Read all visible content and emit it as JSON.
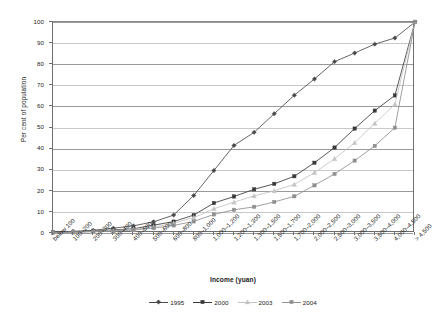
{
  "chart_data": {
    "type": "line",
    "title": "",
    "xlabel": "Income (yuan)",
    "ylabel": "Per cent of population",
    "ylim": [
      0,
      100
    ],
    "yticks": [
      0,
      10,
      20,
      30,
      40,
      50,
      60,
      70,
      80,
      90,
      100
    ],
    "grid": true,
    "legend_position": "bottom",
    "categories": [
      "below 100",
      "100–200",
      "200–300",
      "300–400",
      "400–500",
      "500–600",
      "600–800",
      "800–1,000",
      "1,000–1,200",
      "1,200–1,300",
      "1,300–1,500",
      "1,500–1,700",
      "1,700–2,000",
      "2,000–2,500",
      "2,500–3,000",
      "3,000–3,500",
      "3,500–4,000",
      "4,000–4,500",
      "> 4,500"
    ],
    "series": [
      {
        "name": "1995",
        "color": "#4a4a4a",
        "marker": "diamond",
        "values": [
          0.4,
          0.8,
          1.3,
          2.3,
          3.4,
          5.3,
          8.5,
          17.8,
          29.6,
          41.5,
          47.7,
          56.5,
          65.3,
          73.0,
          81.2,
          85.3,
          89.5,
          92.4,
          100
        ]
      },
      {
        "name": "2000",
        "color": "#3a3a3a",
        "marker": "square",
        "values": [
          0.3,
          0.5,
          0.9,
          1.5,
          2.0,
          3.7,
          5.4,
          8.5,
          14.2,
          17.3,
          20.7,
          23.3,
          26.9,
          33.3,
          40.5,
          49.5,
          58.0,
          65.2,
          100
        ]
      },
      {
        "name": "2003",
        "color": "#c4c4c4",
        "marker": "triangle",
        "values": [
          0.2,
          0.4,
          0.7,
          1.1,
          1.7,
          2.9,
          4.6,
          7.3,
          11.5,
          14.6,
          17.6,
          20.0,
          23.0,
          28.6,
          35.2,
          42.8,
          52.0,
          61.0,
          100
        ]
      },
      {
        "name": "2004",
        "color": "#8f8f8f",
        "marker": "square",
        "values": [
          0.2,
          0.3,
          0.6,
          0.9,
          1.4,
          2.3,
          3.6,
          5.5,
          8.8,
          11.0,
          12.4,
          14.7,
          17.4,
          22.6,
          28.0,
          34.3,
          41.3,
          49.9,
          100
        ]
      }
    ]
  },
  "legend": {
    "items": [
      {
        "label": "1995"
      },
      {
        "label": "2000"
      },
      {
        "label": "2003"
      },
      {
        "label": "2004"
      }
    ]
  }
}
